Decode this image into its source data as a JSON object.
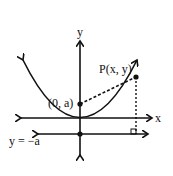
{
  "diagram": {
    "type": "parabola-focus-directrix",
    "labels": {
      "y_axis": "y",
      "x_axis": "x",
      "focus": "(0, a)",
      "point": "P(x, y)",
      "directrix": "y = −a"
    },
    "colors": {
      "stroke": "#111111",
      "background": "#ffffff"
    }
  }
}
